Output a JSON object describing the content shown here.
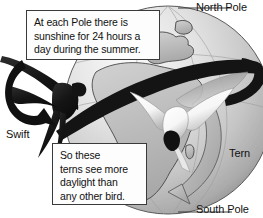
{
  "diagram": {
    "background_color": "#ffffff",
    "globe": {
      "name": "earth-globe",
      "center_x": 168,
      "center_y": 110,
      "radius": 104,
      "fill_light": "#f2f2f2",
      "fill_mid": "#c9c9c9",
      "fill_dark": "#9a9a9a",
      "outline_color": "#4a4a4a",
      "continents_visible": [
        "Europe",
        "Africa",
        "Middle East"
      ]
    },
    "orbit_band": {
      "name": "migration-path-band",
      "color": "#141414",
      "description": "dark diagonal band encircling the globe"
    },
    "south_arrow": {
      "name": "tern-route-arrow",
      "color": "#b0b0b0",
      "outline": "#555555"
    },
    "swift": {
      "name": "swift-bird",
      "color": "#171717",
      "arrow_color": "#111111"
    },
    "tern": {
      "name": "tern-bird",
      "body_color": "#fdfdfd",
      "shadow_color": "#6f6f6f",
      "beak_color": "#121212"
    },
    "leader_lines": {
      "color": "#3a3a3a"
    }
  },
  "callouts": {
    "top": {
      "lines": [
        "At each Pole there is",
        "sunshine for 24 hours a",
        "day during the summer."
      ],
      "line1": "At each Pole there is",
      "line2": "sunshine for 24 hours a",
      "line3": "day during the summer."
    },
    "bottom": {
      "lines": [
        "So these",
        "terns see more",
        "daylight than",
        "any other bird."
      ],
      "line1": "So these",
      "line2": "terns see more",
      "line3": "daylight than",
      "line4": "any other bird."
    }
  },
  "labels": {
    "north_pole": "North Pole",
    "south_pole": "South Pole",
    "swift": "Swift",
    "tern": "Tern"
  }
}
